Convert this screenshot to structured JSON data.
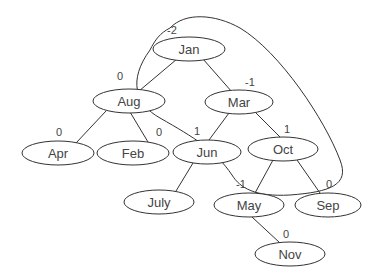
{
  "diagram": {
    "type": "binary-tree",
    "nodes": [
      {
        "id": "jan",
        "label": "Jan",
        "balance": "-2",
        "cx": 189,
        "cy": 49
      },
      {
        "id": "aug",
        "label": "Aug",
        "balance": "0",
        "cx": 129,
        "cy": 101
      },
      {
        "id": "mar",
        "label": "Mar",
        "balance": "-1",
        "cx": 239,
        "cy": 102
      },
      {
        "id": "apr",
        "label": "Apr",
        "balance": "0",
        "cx": 58,
        "cy": 153
      },
      {
        "id": "feb",
        "label": "Feb",
        "balance": "0",
        "cx": 133,
        "cy": 153
      },
      {
        "id": "jun",
        "label": "Jun",
        "balance": "1",
        "cx": 207,
        "cy": 152
      },
      {
        "id": "oct",
        "label": "Oct",
        "balance": "1",
        "cx": 283,
        "cy": 149
      },
      {
        "id": "july",
        "label": "July",
        "balance": "",
        "cx": 159,
        "cy": 202
      },
      {
        "id": "may",
        "label": "May",
        "balance": "-1",
        "cx": 249,
        "cy": 205
      },
      {
        "id": "sep",
        "label": "Sep",
        "balance": "0",
        "cx": 328,
        "cy": 205
      },
      {
        "id": "nov",
        "label": "Nov",
        "balance": "0",
        "cx": 290,
        "cy": 254
      }
    ],
    "edges": [
      [
        "jan",
        "aug"
      ],
      [
        "jan",
        "mar"
      ],
      [
        "aug",
        "apr"
      ],
      [
        "aug",
        "feb"
      ],
      [
        "mar",
        "jun"
      ],
      [
        "mar",
        "oct"
      ],
      [
        "jun",
        "july"
      ],
      [
        "oct",
        "may"
      ],
      [
        "oct",
        "sep"
      ],
      [
        "may",
        "nov"
      ]
    ],
    "highlight_outline": {
      "description": "Loop enclosing Jan, Mar, Oct (rotation path)",
      "encloses": [
        "jan",
        "mar",
        "oct"
      ]
    },
    "colors": {
      "stroke": "#333333",
      "text": "#444444",
      "background": "#ffffff"
    }
  }
}
